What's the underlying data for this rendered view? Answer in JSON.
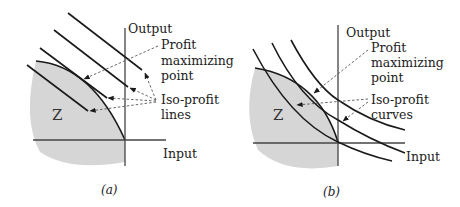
{
  "colors": {
    "region_fill": "#d6d6d6",
    "line": "#1a1a1a",
    "axis": "#444444",
    "leader": "#555555",
    "background": "#ffffff"
  },
  "panel_a": {
    "caption": "(a)",
    "y_axis_label": "Output",
    "x_axis_label": "Input",
    "region_label": "Z",
    "annotation_1": {
      "lines": [
        "Profit",
        "maximizing",
        "point"
      ]
    },
    "annotation_2": {
      "lines": [
        "Iso-profit",
        "lines"
      ]
    },
    "iso_profit_shape": "straight lines"
  },
  "panel_b": {
    "caption": "(b)",
    "y_axis_label": "Output",
    "x_axis_label": "Input",
    "region_label": "Z",
    "annotation_1": {
      "lines": [
        "Profit",
        "maximizing",
        "point"
      ]
    },
    "annotation_2": {
      "lines": [
        "Iso-profit",
        "curves"
      ]
    },
    "iso_profit_shape": "convex curves"
  }
}
